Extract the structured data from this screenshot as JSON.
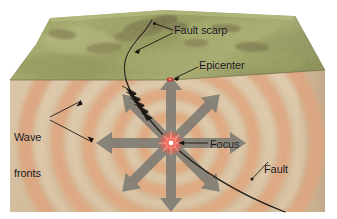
{
  "figure": {
    "type": "geology-block-diagram"
  },
  "labels": {
    "fault_scarp": "Fault scarp",
    "epicenter": "Epicenter",
    "wave_fronts_line1": "Wave",
    "wave_fronts_line2": "fronts",
    "focus": "Focus",
    "fault": "Fault"
  },
  "colors": {
    "grass_light": "#a9ae6a",
    "grass_mid": "#939a57",
    "grass_dark": "#767c45",
    "grass_side": "#8f9455",
    "rock_base": "#d8c4a4",
    "rock_front": "#dfcdb0",
    "rock_side": "#cdb695",
    "wave_band": "#e0a982",
    "wave_band_soft": "#e8bd9d",
    "arrow_gray": "#7d7a74",
    "fault_line": "#24201c",
    "focus_core": "#ffffff",
    "focus_glow": "#e8524a",
    "epicenter_dot": "#c6342c",
    "label_text": "#171310",
    "page_bg": "#ffffff"
  },
  "elements": {
    "block": {
      "name": "crustal block",
      "faces": [
        "top-grass-surface",
        "front-cutaway",
        "right-cutaway"
      ]
    },
    "wave_fronts": {
      "name": "seismic wave fronts",
      "count": 5,
      "shape": "concentric ellipses"
    },
    "radiating_arrows": {
      "name": "seismic energy arrows",
      "count": 8,
      "directions": [
        "up",
        "up-right",
        "right",
        "down-right",
        "down",
        "down-left",
        "left",
        "up-left"
      ]
    },
    "focus_point": {
      "name": "earthquake focus (hypocenter)",
      "x": 171,
      "y": 143
    },
    "epicenter_point": {
      "name": "epicenter on surface",
      "x": 171,
      "y": 80
    },
    "fault": {
      "name": "fault plane trace",
      "slip_arrowheads": 5
    }
  }
}
